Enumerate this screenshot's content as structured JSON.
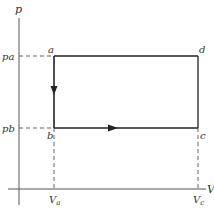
{
  "diagram": {
    "type": "pV-diagram",
    "axes": {
      "y_label": "p",
      "x_label": "V"
    },
    "points": {
      "a": "a",
      "b": "b",
      "c": "c",
      "d": "d"
    },
    "tick_labels": {
      "pa": "pa",
      "pb": "pb",
      "Va": "V",
      "Va_sub": "a",
      "Vc": "V",
      "Vc_sub": "c"
    },
    "paths": [
      {
        "from": "a",
        "to": "b",
        "direction": "down",
        "arrow": true
      },
      {
        "from": "b",
        "to": "c",
        "direction": "right",
        "arrow": true
      },
      {
        "from": "c",
        "to": "d",
        "arrow": false
      },
      {
        "from": "a",
        "to": "d",
        "arrow": false
      }
    ],
    "colors": {
      "axis": "#555555",
      "path": "#222222",
      "dashed": "#666666",
      "text": "#333333"
    }
  }
}
